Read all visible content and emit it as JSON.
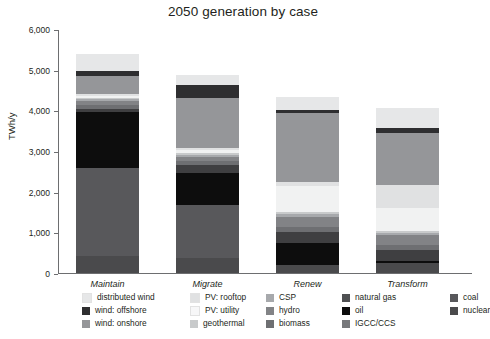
{
  "chart_data": {
    "type": "bar",
    "subtype": "stacked-bar",
    "title": "2050 generation by case",
    "xlabel": "",
    "ylabel": "TWh/y",
    "ylim": [
      0,
      6000
    ],
    "yticks": [
      0,
      1000,
      2000,
      3000,
      4000,
      5000,
      6000
    ],
    "ytick_labels": [
      "0",
      "1,000",
      "2,000",
      "3,000",
      "4,000",
      "5,000",
      "6,000"
    ],
    "grid": false,
    "legend_position": "bottom",
    "categories": [
      "Maintain",
      "Migrate",
      "Renew",
      "Transform"
    ],
    "totals": [
      5390,
      4870,
      4330,
      4060
    ],
    "series": [
      {
        "name": "nuclear",
        "color": "#4a4a4c",
        "values": [
          420,
          380,
          205,
          245
        ]
      },
      {
        "name": "coal",
        "color": "#58585b",
        "values": [
          2160,
          1300,
          0,
          0
        ]
      },
      {
        "name": "IGCC/CCS",
        "color": "#77787b",
        "values": [
          0,
          0,
          0,
          0
        ]
      },
      {
        "name": "oil",
        "color": "#0d0d0d",
        "values": [
          1370,
          770,
          530,
          50
        ]
      },
      {
        "name": "natural gas",
        "color": "#3f3f41",
        "values": [
          95,
          195,
          275,
          280
        ]
      },
      {
        "name": "biomass",
        "color": "#6e6f72",
        "values": [
          90,
          100,
          130,
          120
        ]
      },
      {
        "name": "hydro",
        "color": "#828386",
        "values": [
          105,
          105,
          240,
          235
        ]
      },
      {
        "name": "CSP",
        "color": "#a7a9ac",
        "values": [
          35,
          55,
          75,
          60
        ]
      },
      {
        "name": "geothermal",
        "color": "#c8cacb",
        "values": [
          35,
          40,
          55,
          50
        ]
      },
      {
        "name": "PV: utility",
        "color": "#f1f2f2",
        "values": [
          50,
          70,
          620,
          560
        ]
      },
      {
        "name": "PV: rooftop",
        "color": "#e0e1e2",
        "values": [
          50,
          70,
          100,
          560
        ]
      },
      {
        "name": "wind: onshore",
        "color": "#959699",
        "values": [
          440,
          1210,
          1700,
          1280
        ]
      },
      {
        "name": "wind: offshore",
        "color": "#2e2e30",
        "values": [
          130,
          330,
          75,
          120
        ]
      },
      {
        "name": "distributed wind",
        "color": "#e6e7e8",
        "values": [
          410,
          245,
          325,
          500
        ]
      }
    ],
    "bars": [
      {
        "category": "Maintain",
        "total": 5390,
        "segments": [
          {
            "name": "nuclear",
            "value": 420,
            "color": "#4a4a4c"
          },
          {
            "name": "coal",
            "value": 2160,
            "color": "#58585b"
          },
          {
            "name": "oil",
            "value": 1370,
            "color": "#0d0d0d"
          },
          {
            "name": "natural gas",
            "value": 95,
            "color": "#3f3f41"
          },
          {
            "name": "biomass",
            "value": 90,
            "color": "#6e6f72"
          },
          {
            "name": "hydro",
            "value": 105,
            "color": "#828386"
          },
          {
            "name": "CSP",
            "value": 35,
            "color": "#a7a9ac"
          },
          {
            "name": "geothermal",
            "value": 35,
            "color": "#c8cacb"
          },
          {
            "name": "PV: utility",
            "value": 50,
            "color": "#f1f2f2"
          },
          {
            "name": "PV: rooftop",
            "value": 50,
            "color": "#e0e1e2"
          },
          {
            "name": "wind: onshore",
            "value": 440,
            "color": "#959699"
          },
          {
            "name": "wind: offshore",
            "value": 130,
            "color": "#2e2e30"
          },
          {
            "name": "distributed wind",
            "value": 410,
            "color": "#e6e7e8"
          }
        ]
      },
      {
        "category": "Migrate",
        "total": 4870,
        "segments": [
          {
            "name": "nuclear",
            "value": 380,
            "color": "#4a4a4c"
          },
          {
            "name": "coal",
            "value": 1300,
            "color": "#58585b"
          },
          {
            "name": "oil",
            "value": 770,
            "color": "#0d0d0d"
          },
          {
            "name": "natural gas",
            "value": 195,
            "color": "#3f3f41"
          },
          {
            "name": "biomass",
            "value": 100,
            "color": "#6e6f72"
          },
          {
            "name": "hydro",
            "value": 105,
            "color": "#828386"
          },
          {
            "name": "CSP",
            "value": 55,
            "color": "#a7a9ac"
          },
          {
            "name": "geothermal",
            "value": 40,
            "color": "#c8cacb"
          },
          {
            "name": "PV: utility",
            "value": 70,
            "color": "#f1f2f2"
          },
          {
            "name": "PV: rooftop",
            "value": 70,
            "color": "#e0e1e2"
          },
          {
            "name": "wind: onshore",
            "value": 1210,
            "color": "#959699"
          },
          {
            "name": "wind: offshore",
            "value": 330,
            "color": "#2e2e30"
          },
          {
            "name": "distributed wind",
            "value": 245,
            "color": "#e6e7e8"
          }
        ]
      },
      {
        "category": "Renew",
        "total": 4330,
        "segments": [
          {
            "name": "nuclear",
            "value": 205,
            "color": "#4a4a4c"
          },
          {
            "name": "oil",
            "value": 530,
            "color": "#0d0d0d"
          },
          {
            "name": "natural gas",
            "value": 275,
            "color": "#3f3f41"
          },
          {
            "name": "biomass",
            "value": 130,
            "color": "#6e6f72"
          },
          {
            "name": "hydro",
            "value": 240,
            "color": "#828386"
          },
          {
            "name": "CSP",
            "value": 75,
            "color": "#a7a9ac"
          },
          {
            "name": "geothermal",
            "value": 55,
            "color": "#c8cacb"
          },
          {
            "name": "PV: utility",
            "value": 620,
            "color": "#f1f2f2"
          },
          {
            "name": "PV: rooftop",
            "value": 100,
            "color": "#e0e1e2"
          },
          {
            "name": "wind: onshore",
            "value": 1700,
            "color": "#959699"
          },
          {
            "name": "wind: offshore",
            "value": 75,
            "color": "#2e2e30"
          },
          {
            "name": "distributed wind",
            "value": 325,
            "color": "#e6e7e8"
          }
        ]
      },
      {
        "category": "Transform",
        "total": 4060,
        "segments": [
          {
            "name": "nuclear",
            "value": 245,
            "color": "#4a4a4c"
          },
          {
            "name": "oil",
            "value": 50,
            "color": "#0d0d0d"
          },
          {
            "name": "natural gas",
            "value": 280,
            "color": "#3f3f41"
          },
          {
            "name": "biomass",
            "value": 120,
            "color": "#6e6f72"
          },
          {
            "name": "hydro",
            "value": 235,
            "color": "#828386"
          },
          {
            "name": "CSP",
            "value": 60,
            "color": "#a7a9ac"
          },
          {
            "name": "geothermal",
            "value": 50,
            "color": "#c8cacb"
          },
          {
            "name": "PV: utility",
            "value": 560,
            "color": "#f1f2f2"
          },
          {
            "name": "PV: rooftop",
            "value": 560,
            "color": "#e0e1e2"
          },
          {
            "name": "wind: onshore",
            "value": 1280,
            "color": "#959699"
          },
          {
            "name": "wind: offshore",
            "value": 120,
            "color": "#2e2e30"
          },
          {
            "name": "distributed wind",
            "value": 500,
            "color": "#e6e7e8"
          }
        ]
      }
    ],
    "legend": [
      {
        "label": "distributed wind",
        "color": "#e6e7e8"
      },
      {
        "label": "wind: offshore",
        "color": "#2e2e30"
      },
      {
        "label": "wind: onshore",
        "color": "#959699"
      },
      {
        "label": "PV: rooftop",
        "color": "#e0e1e2"
      },
      {
        "label": "PV: utility",
        "color": "#f7f7f8"
      },
      {
        "label": "geothermal",
        "color": "#c8cacb"
      },
      {
        "label": "CSP",
        "color": "#a7a9ac"
      },
      {
        "label": "hydro",
        "color": "#828386"
      },
      {
        "label": "biomass",
        "color": "#6e6f72"
      },
      {
        "label": "natural gas",
        "color": "#4f5052"
      },
      {
        "label": "oil",
        "color": "#0d0d0d"
      },
      {
        "label": "IGCC/CCS",
        "color": "#77787b"
      },
      {
        "label": "coal",
        "color": "#58585b"
      },
      {
        "label": "nuclear",
        "color": "#4a4a4c"
      }
    ],
    "legend_columns": [
      [
        "distributed wind",
        "wind: offshore",
        "wind: onshore"
      ],
      [
        "PV: rooftop",
        "PV: utility",
        "geothermal"
      ],
      [
        "CSP",
        "hydro",
        "biomass"
      ],
      [
        "natural gas",
        "oil",
        "IGCC/CCS"
      ],
      [
        "coal",
        "nuclear"
      ]
    ]
  },
  "axis_colors": {
    "axis_line": "#6d6e70",
    "text": "#231f20",
    "background": "#ffffff"
  }
}
